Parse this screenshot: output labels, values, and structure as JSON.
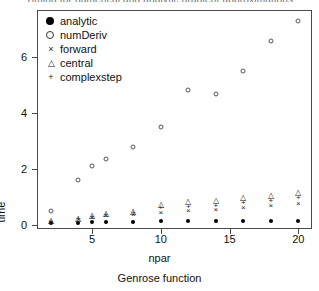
{
  "chart_data": {
    "type": "scatter",
    "title": "Timing for numerical and analytic gradient approximations",
    "xlabel": "npar",
    "ylabel": "time",
    "subtitle": "Genrose function",
    "xlim": [
      1,
      21
    ],
    "ylim": [
      -0.15,
      7.7
    ],
    "xticks": [
      "5",
      "10",
      "15",
      "20"
    ],
    "xtick_values": [
      5,
      10,
      15,
      20
    ],
    "yticks": [
      "0",
      "2",
      "4",
      "6"
    ],
    "ytick_values": [
      0,
      2,
      4,
      6
    ],
    "grid": false,
    "legend_position": "top-left",
    "x": [
      2,
      4,
      5,
      6,
      8,
      10,
      12,
      14,
      16,
      18,
      20
    ],
    "series": [
      {
        "name": "analytic",
        "marker": "filled-circle",
        "values": [
          0.05,
          0.08,
          0.09,
          0.1,
          0.11,
          0.12,
          0.12,
          0.13,
          0.13,
          0.14,
          0.15
        ]
      },
      {
        "name": "numDeriv",
        "marker": "open-circle",
        "values": [
          0.5,
          1.6,
          2.1,
          2.35,
          2.8,
          3.5,
          4.85,
          4.7,
          5.5,
          6.6,
          7.3
        ]
      },
      {
        "name": "forward",
        "marker": "cross-x",
        "values": [
          0.1,
          0.18,
          0.24,
          0.3,
          0.36,
          0.43,
          0.5,
          0.54,
          0.62,
          0.69,
          0.76
        ]
      },
      {
        "name": "central",
        "marker": "triangle",
        "values": [
          0.12,
          0.22,
          0.3,
          0.38,
          0.47,
          0.72,
          0.8,
          0.84,
          0.95,
          1.05,
          1.15
        ]
      },
      {
        "name": "complexstep",
        "marker": "plus",
        "values": [
          0.11,
          0.2,
          0.27,
          0.34,
          0.41,
          0.6,
          0.64,
          0.68,
          0.78,
          0.86,
          0.95
        ]
      }
    ]
  },
  "legend": {
    "items": [
      {
        "label": "analytic",
        "marker": "filled-circle",
        "glyph": ""
      },
      {
        "label": "numDeriv",
        "marker": "open-circle",
        "glyph": ""
      },
      {
        "label": "forward",
        "marker": "cross-x",
        "glyph": "×"
      },
      {
        "label": "central",
        "marker": "triangle",
        "glyph": "△"
      },
      {
        "label": "complexstep",
        "marker": "plus",
        "glyph": "+"
      }
    ]
  },
  "colors": {
    "axis": "#4a4a4a",
    "text": "#111111",
    "marker": "#222222",
    "background": "#ffffff"
  }
}
